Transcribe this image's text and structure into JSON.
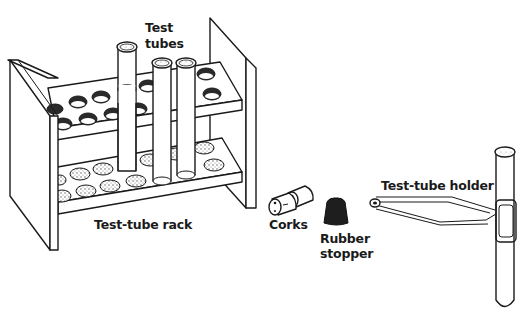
{
  "diagram": {
    "labels": {
      "test_tubes_line1": "Test",
      "test_tubes_line2": "tubes",
      "test_tube_rack": "Test-tube rack",
      "corks": "Corks",
      "rubber_stopper_line1": "Rubber",
      "rubber_stopper_line2": "stopper",
      "test_tube_holder": "Test-tube holder"
    },
    "items": [
      {
        "name": "Test tubes",
        "count_in_rack": 3
      },
      {
        "name": "Test-tube rack",
        "tiers": 2
      },
      {
        "name": "Corks",
        "count": 2
      },
      {
        "name": "Rubber stopper",
        "count": 1
      },
      {
        "name": "Test-tube holder",
        "holding": "test tube"
      }
    ],
    "colors": {
      "ink": "#1a1a1a",
      "background": "#ffffff",
      "stopper": "#1e1e1e"
    }
  }
}
